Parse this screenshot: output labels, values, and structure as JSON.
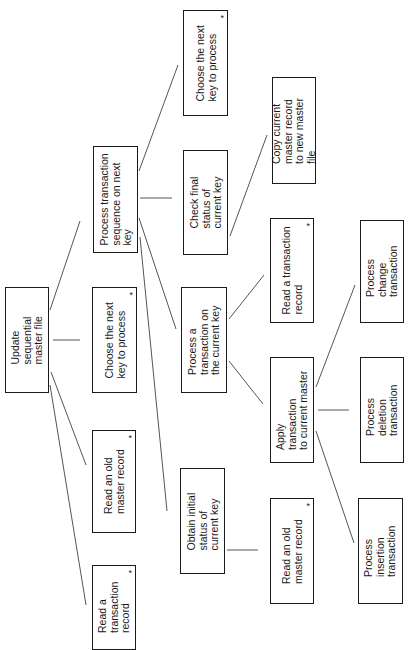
{
  "diagram": {
    "title": "Update sequential master file",
    "orientation": "rotated-90-ccw",
    "nodes": [
      {
        "id": "root",
        "label": "Update\nsequential\nmaster file",
        "star": false,
        "x": 5,
        "y": 287,
        "w": 44,
        "h": 106
      },
      {
        "id": "read-txn-1",
        "label": "Read a\ntransaction\nrecord",
        "star": true,
        "x": 92,
        "y": 565,
        "w": 44,
        "h": 85
      },
      {
        "id": "read-old-1",
        "label": "Read an old\nmaster record",
        "star": true,
        "x": 92,
        "y": 430,
        "w": 44,
        "h": 103
      },
      {
        "id": "choose-key-1",
        "label": "Choose the next\nkey to process",
        "star": true,
        "x": 92,
        "y": 287,
        "w": 45,
        "h": 106
      },
      {
        "id": "proc-seq",
        "label": "Process transaction\nsequence on next\nkey",
        "star": false,
        "x": 93,
        "y": 146,
        "w": 45,
        "h": 107
      },
      {
        "id": "choose-key-2",
        "label": "Choose the next\nkey to process",
        "star": true,
        "x": 183,
        "y": 10,
        "w": 45,
        "h": 106
      },
      {
        "id": "check-final",
        "label": "Check final\nstatus of\ncurrent key",
        "star": false,
        "x": 183,
        "y": 150,
        "w": 45,
        "h": 105
      },
      {
        "id": "proc-txn-current",
        "label": "Process a\ntransaction on\nthe current key",
        "star": false,
        "x": 181,
        "y": 287,
        "w": 46,
        "h": 106
      },
      {
        "id": "obtain-initial",
        "label": "Obtain initial\nstatus of\ncurrent key",
        "star": false,
        "x": 180,
        "y": 468,
        "w": 45,
        "h": 106
      },
      {
        "id": "copy-master",
        "label": "Copy current\nmaster record\nto new master\nfile",
        "star": false,
        "x": 272,
        "y": 77,
        "w": 44,
        "h": 107
      },
      {
        "id": "read-txn-2",
        "label": "Read a transaction\nrecord",
        "star": true,
        "x": 270,
        "y": 218,
        "w": 44,
        "h": 105
      },
      {
        "id": "apply-txn",
        "label": "Apply\ntransaction\nto current master",
        "star": false,
        "x": 270,
        "y": 357,
        "w": 44,
        "h": 106
      },
      {
        "id": "read-old-2",
        "label": "Read an old\nmaster record",
        "star": true,
        "x": 270,
        "y": 498,
        "w": 44,
        "h": 106
      },
      {
        "id": "proc-change",
        "label": "Process\nchange\ntransaction",
        "star": false,
        "x": 360,
        "y": 220,
        "w": 44,
        "h": 103
      },
      {
        "id": "proc-deletion",
        "label": "Process\ndeletion\ntransaction",
        "star": false,
        "x": 360,
        "y": 357,
        "w": 44,
        "h": 106
      },
      {
        "id": "proc-insertion",
        "label": "Process\ninsertion\ntransaction",
        "star": false,
        "x": 358,
        "y": 498,
        "w": 45,
        "h": 106
      }
    ],
    "edges": [
      {
        "from": "root",
        "to": "read-txn-1",
        "x1": 50,
        "y1": 385,
        "x2": 86,
        "y2": 605
      },
      {
        "from": "root",
        "to": "read-old-1",
        "x1": 51,
        "y1": 372,
        "x2": 86,
        "y2": 465
      },
      {
        "from": "root",
        "to": "choose-key-1",
        "x1": 53,
        "y1": 340,
        "x2": 80,
        "y2": 340
      },
      {
        "from": "root",
        "to": "proc-seq",
        "x1": 50,
        "y1": 310,
        "x2": 80,
        "y2": 221
      },
      {
        "from": "proc-seq",
        "to": "choose-key-2",
        "x1": 139,
        "y1": 171,
        "x2": 178,
        "y2": 65
      },
      {
        "from": "proc-seq",
        "to": "check-final",
        "x1": 140,
        "y1": 198,
        "x2": 172,
        "y2": 198
      },
      {
        "from": "proc-seq",
        "to": "proc-txn-current",
        "x1": 139,
        "y1": 218,
        "x2": 176,
        "y2": 329
      },
      {
        "from": "proc-seq",
        "to": "obtain-initial",
        "x1": 140,
        "y1": 237,
        "x2": 167,
        "y2": 511
      },
      {
        "from": "check-final",
        "to": "copy-master",
        "x1": 230,
        "y1": 236,
        "x2": 267,
        "y2": 135
      },
      {
        "from": "obtain-initial",
        "to": "read-old-2",
        "x1": 227,
        "y1": 550,
        "x2": 258,
        "y2": 550
      },
      {
        "from": "proc-txn-current",
        "to": "read-txn-2",
        "x1": 229,
        "y1": 319,
        "x2": 264,
        "y2": 275
      },
      {
        "from": "proc-txn-current",
        "to": "apply-txn",
        "x1": 229,
        "y1": 361,
        "x2": 263,
        "y2": 404
      },
      {
        "from": "apply-txn",
        "to": "proc-change",
        "x1": 316,
        "y1": 387,
        "x2": 355,
        "y2": 285
      },
      {
        "from": "apply-txn",
        "to": "proc-deletion",
        "x1": 318,
        "y1": 410,
        "x2": 349,
        "y2": 410
      },
      {
        "from": "apply-txn",
        "to": "proc-insertion",
        "x1": 316,
        "y1": 431,
        "x2": 354,
        "y2": 543
      }
    ]
  },
  "colors": {
    "line": "#555555",
    "border": "#1a1a1a",
    "background": "#ffffff",
    "text": "#1a1a1a"
  }
}
